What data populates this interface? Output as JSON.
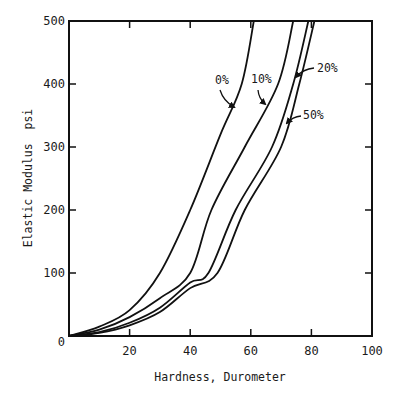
{
  "chart_data": {
    "type": "line",
    "title": "",
    "xlabel": "Hardness, Durometer",
    "ylabel": "Elastic Modulus  psi",
    "xlim": [
      0,
      100
    ],
    "ylim": [
      0,
      500
    ],
    "x_ticks": [
      0,
      20,
      40,
      60,
      80,
      100
    ],
    "x_tick_labels": [
      "",
      "20",
      "40",
      "60",
      "80",
      "100"
    ],
    "y_ticks": [
      0,
      100,
      200,
      300,
      400,
      500
    ],
    "y_tick_labels": [
      "0",
      "100",
      "200",
      "300",
      "400",
      "500"
    ],
    "grid": false,
    "legend": "inline labels with arrows",
    "series": [
      {
        "name": "0%",
        "points": [
          [
            0,
            0
          ],
          [
            10,
            15
          ],
          [
            20,
            41
          ],
          [
            30,
            100
          ],
          [
            40,
            200
          ],
          [
            50,
            320
          ],
          [
            57,
            400
          ],
          [
            61,
            500
          ]
        ]
      },
      {
        "name": "10%",
        "points": [
          [
            0,
            0
          ],
          [
            10,
            10
          ],
          [
            20,
            30
          ],
          [
            30,
            60
          ],
          [
            40,
            100
          ],
          [
            47,
            200
          ],
          [
            58,
            300
          ],
          [
            69,
            400
          ],
          [
            74,
            500
          ]
        ]
      },
      {
        "name": "20%",
        "points": [
          [
            0,
            0
          ],
          [
            10,
            6
          ],
          [
            20,
            21
          ],
          [
            30,
            45
          ],
          [
            40,
            85
          ],
          [
            46,
            100
          ],
          [
            55,
            200
          ],
          [
            67,
            300
          ],
          [
            74,
            400
          ],
          [
            79,
            500
          ]
        ]
      },
      {
        "name": "50%",
        "points": [
          [
            0,
            0
          ],
          [
            10,
            5
          ],
          [
            20,
            17
          ],
          [
            30,
            38
          ],
          [
            40,
            76
          ],
          [
            49,
            100
          ],
          [
            58,
            200
          ],
          [
            70,
            300
          ],
          [
            76,
            400
          ],
          [
            81,
            500
          ]
        ]
      }
    ],
    "annotations": [
      {
        "text": "0%",
        "label_xy": [
          215,
          84
        ],
        "arrow_from": [
          220,
          90
        ],
        "arrow_to": [
          234,
          107
        ]
      },
      {
        "text": "10%",
        "label_xy": [
          251,
          83
        ],
        "arrow_from": [
          258,
          90
        ],
        "arrow_to": [
          265,
          104
        ]
      },
      {
        "text": "20%",
        "label_xy": [
          317,
          72
        ],
        "arrow_from": [
          314,
          68
        ],
        "arrow_to": [
          296,
          77
        ]
      },
      {
        "text": "50%",
        "label_xy": [
          303,
          119
        ],
        "arrow_from": [
          301,
          116
        ],
        "arrow_to": [
          287,
          123
        ]
      }
    ]
  }
}
